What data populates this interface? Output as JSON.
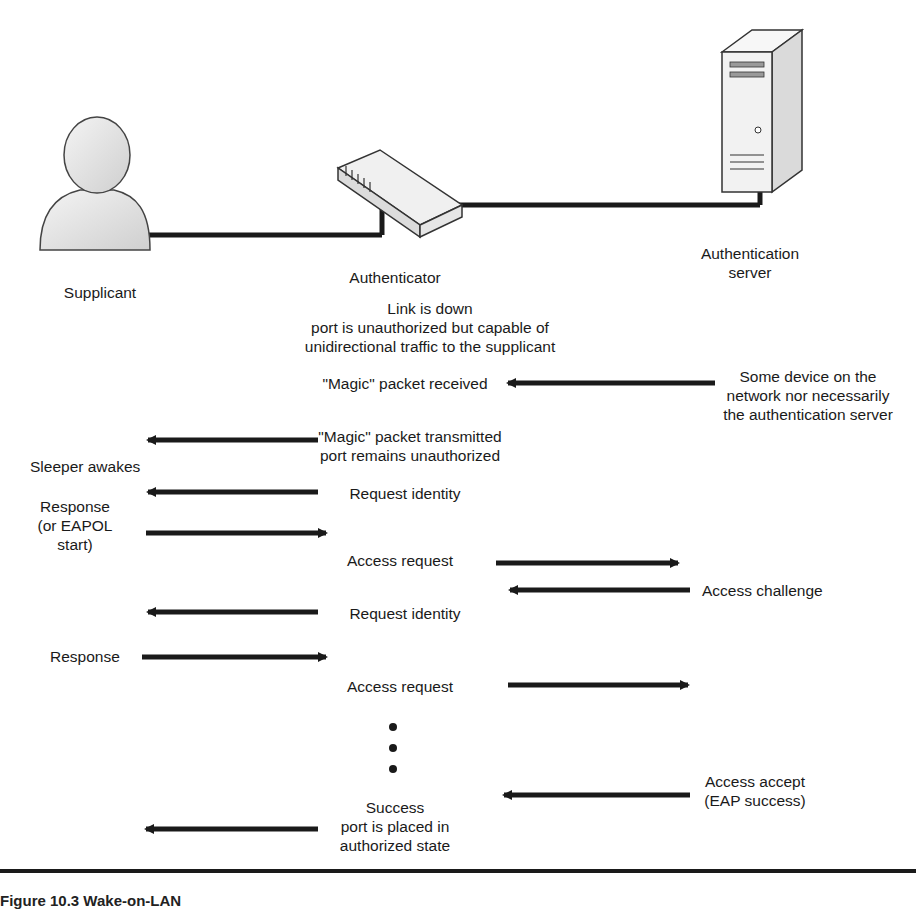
{
  "figure": {
    "caption": "Figure 10.3  Wake-on-LAN"
  },
  "entities": {
    "supplicant": {
      "label": "Supplicant",
      "icon": "person-icon"
    },
    "authenticator": {
      "label": "Authenticator",
      "icon": "switch-icon"
    },
    "auth_server": {
      "label_line1": "Authentication",
      "label_line2": "server",
      "icon": "server-icon"
    }
  },
  "authenticator_state": {
    "line1": "Link is down",
    "line2": "port is unauthorized but capable of",
    "line3": "unidirectional traffic to the supplicant"
  },
  "messages": [
    {
      "id": "magic-received",
      "text": "\"Magic\" packet received",
      "direction": "left",
      "from": "network-device",
      "to": "authenticator"
    },
    {
      "id": "network-device",
      "line1": "Some device on the",
      "line2": "network nor necessarily",
      "line3": "the authentication server"
    },
    {
      "id": "magic-transmitted",
      "line1": "\"Magic\" packet transmitted",
      "line2": "port remains unauthorized",
      "direction": "left",
      "from": "authenticator",
      "to": "supplicant"
    },
    {
      "id": "sleeper",
      "text": "Sleeper awakes"
    },
    {
      "id": "request-identity-1",
      "text": "Request identity",
      "direction": "left"
    },
    {
      "id": "response-1",
      "line1": "Response",
      "line2": "(or EAPOL",
      "line3": "start)",
      "direction": "right"
    },
    {
      "id": "access-request-1",
      "text": "Access request",
      "direction": "right"
    },
    {
      "id": "access-challenge",
      "text": "Access challenge",
      "direction": "left"
    },
    {
      "id": "request-identity-2",
      "text": "Request identity",
      "direction": "left"
    },
    {
      "id": "response-2",
      "text": "Response",
      "direction": "right"
    },
    {
      "id": "access-request-2",
      "text": "Access request",
      "direction": "right"
    },
    {
      "id": "access-accept",
      "line1": "Access accept",
      "line2": "(EAP success)",
      "direction": "left"
    },
    {
      "id": "success",
      "line1": "Success",
      "line2": "port is placed in",
      "line3": "authorized state",
      "direction": "left"
    }
  ],
  "colors": {
    "line": "#1a1a1a",
    "device_fill": "#f2f2f2",
    "device_stroke": "#333333",
    "person_fill": "#e6e6e6"
  }
}
